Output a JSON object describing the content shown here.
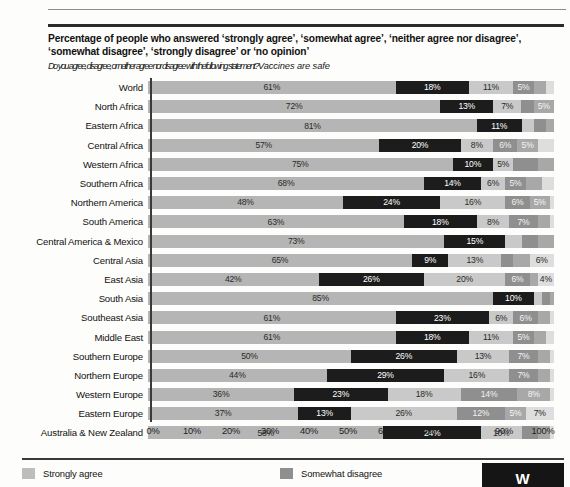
{
  "title": "Percentage of people who answered ‘strongly agree’, ‘somewhat agree’, ‘neither agree nor disagree’, ‘somewhat disagree’, ‘strongly disagree’ or ‘no opinion’",
  "subtitle_a": "Do you agree, disagree, or neither agree nor disagree with the",
  "subtitle_b": "following statement?",
  "subtitle_c": "Vaccines are safe",
  "legend": {
    "items": [
      {
        "label": "Strongly agree",
        "color": "#bdbdbd"
      },
      {
        "label": "Somewhat disagree",
        "color": "#8f8f8f"
      }
    ]
  },
  "logo_text": "W",
  "chart_data": {
    "type": "bar",
    "orientation": "horizontal",
    "stacked": true,
    "title": "Percentage of people who answered ‘strongly agree’, ‘somewhat agree’, ‘neither agree nor disagree’, ‘somewhat disagree’, ‘strongly disagree’ or ‘no opinion’",
    "subtitle": "Do you agree, disagree, or neither agree nor disagree with the following statement? Vaccines are safe",
    "xlabel": "",
    "ylabel": "",
    "xlim": [
      0,
      100
    ],
    "xticks": [
      0,
      10,
      20,
      30,
      40,
      50,
      60,
      70,
      80,
      90,
      100
    ],
    "xticklabels": [
      "0%",
      "10%",
      "20%",
      "30%",
      "40%",
      "50%",
      "60%",
      "70%",
      "80%",
      "90%",
      "100%"
    ],
    "grid": false,
    "legend_position": "bottom",
    "series": [
      {
        "name": "Strongly agree",
        "color": "#b5b5b5"
      },
      {
        "name": "Somewhat agree",
        "color": "#1c1c1c"
      },
      {
        "name": "Neither agree nor disagree",
        "color": "#c9c9c9"
      },
      {
        "name": "Somewhat disagree",
        "color": "#8f8f8f"
      },
      {
        "name": "Strongly disagree",
        "color": "#a8a8a8"
      },
      {
        "name": "No opinion",
        "color": "#dedede"
      }
    ],
    "categories": [
      "World",
      "North Africa",
      "Eastern Africa",
      "Central Africa",
      "Western Africa",
      "Southern Africa",
      "Northern America",
      "South America",
      "Central America & Mexico",
      "Central Asia",
      "East Asia",
      "South Asia",
      "Southeast Asia",
      "Middle East",
      "Southern Europe",
      "Northern Europe",
      "Western Europe",
      "Eastern Europe",
      "Australia & New Zealand"
    ],
    "rows": [
      {
        "label": "World",
        "values": [
          61,
          18,
          11,
          5,
          3,
          2
        ],
        "labels": [
          "61%",
          "18%",
          "11%",
          "5%",
          "",
          ""
        ]
      },
      {
        "label": "North Africa",
        "values": [
          72,
          13,
          7,
          3,
          5,
          0
        ],
        "labels": [
          "72%",
          "13%",
          "7%",
          "",
          "5%",
          ""
        ]
      },
      {
        "label": "Eastern Africa",
        "values": [
          81,
          11,
          3,
          3,
          2,
          0
        ],
        "labels": [
          "81%",
          "11%",
          "",
          "",
          "",
          ""
        ]
      },
      {
        "label": "Central Africa",
        "values": [
          57,
          20,
          8,
          6,
          5,
          4
        ],
        "labels": [
          "57%",
          "20%",
          "8%",
          "6%",
          "5%",
          ""
        ]
      },
      {
        "label": "Western Africa",
        "values": [
          75,
          10,
          5,
          6,
          4,
          0
        ],
        "labels": [
          "75%",
          "10%",
          "5%",
          "",
          "",
          ""
        ]
      },
      {
        "label": "Southern Africa",
        "values": [
          68,
          14,
          6,
          5,
          4,
          3
        ],
        "labels": [
          "68%",
          "14%",
          "6%",
          "5%",
          "",
          ""
        ]
      },
      {
        "label": "Northern America",
        "values": [
          48,
          24,
          16,
          6,
          5,
          1
        ],
        "labels": [
          "48%",
          "24%",
          "16%",
          "6%",
          "5%",
          ""
        ]
      },
      {
        "label": "South America",
        "values": [
          63,
          18,
          8,
          7,
          3,
          1
        ],
        "labels": [
          "63%",
          "18%",
          "8%",
          "7%",
          "",
          ""
        ]
      },
      {
        "label": "Central America & Mexico",
        "values": [
          73,
          15,
          4,
          4,
          4,
          0
        ],
        "labels": [
          "73%",
          "15%",
          "",
          "",
          "",
          ""
        ]
      },
      {
        "label": "Central Asia",
        "values": [
          65,
          9,
          13,
          3,
          4,
          6
        ],
        "labels": [
          "65%",
          "9%",
          "13%",
          "",
          "",
          "6%"
        ]
      },
      {
        "label": "East Asia",
        "values": [
          42,
          26,
          20,
          6,
          2,
          4
        ],
        "labels": [
          "42%",
          "26%",
          "20%",
          "6%",
          "",
          "4%"
        ]
      },
      {
        "label": "South Asia",
        "values": [
          85,
          10,
          2,
          2,
          1,
          0
        ],
        "labels": [
          "85%",
          "10%",
          "",
          "",
          "",
          ""
        ]
      },
      {
        "label": "Southeast Asia",
        "values": [
          61,
          23,
          6,
          6,
          3,
          1
        ],
        "labels": [
          "61%",
          "23%",
          "6%",
          "6%",
          "",
          ""
        ]
      },
      {
        "label": "Middle East",
        "values": [
          61,
          18,
          11,
          5,
          3,
          2
        ],
        "labels": [
          "61%",
          "18%",
          "11%",
          "5%",
          "",
          ""
        ]
      },
      {
        "label": "Southern Europe",
        "values": [
          50,
          26,
          13,
          7,
          3,
          1
        ],
        "labels": [
          "50%",
          "26%",
          "13%",
          "7%",
          "",
          ""
        ]
      },
      {
        "label": "Northern Europe",
        "values": [
          44,
          29,
          16,
          7,
          3,
          1
        ],
        "labels": [
          "44%",
          "29%",
          "16%",
          "7%",
          "",
          ""
        ]
      },
      {
        "label": "Western Europe",
        "values": [
          36,
          23,
          18,
          14,
          8,
          1
        ],
        "labels": [
          "36%",
          "23%",
          "18%",
          "14%",
          "8%",
          ""
        ]
      },
      {
        "label": "Eastern Europe",
        "values": [
          37,
          13,
          26,
          12,
          5,
          7
        ],
        "labels": [
          "37%",
          "13%",
          "26%",
          "12%",
          "5%",
          "7%"
        ]
      },
      {
        "label": "Australia & New Zealand",
        "values": [
          58,
          24,
          10,
          4,
          3,
          1
        ],
        "labels": [
          "58%",
          "24%",
          "10%",
          "",
          "",
          ""
        ]
      }
    ]
  }
}
